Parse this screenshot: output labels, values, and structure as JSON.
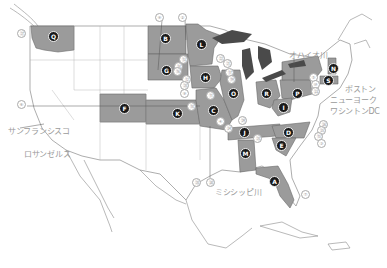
{
  "colors": {
    "highlight_state": "#9b9b9b",
    "land": "#ffffff",
    "border": "#8a8a8a",
    "water": "#4a4a4a",
    "label_text": "#9a9a9a",
    "marker_bg": "#1a1a1a"
  },
  "cities": [
    {
      "id": "sf",
      "label": "サンフランシスコ",
      "x": 8,
      "y": 128
    },
    {
      "id": "la",
      "label": "ロサンゼルス",
      "x": 24,
      "y": 151
    },
    {
      "id": "boston",
      "label": "ボストン",
      "x": 345,
      "y": 86
    },
    {
      "id": "nyc",
      "label": "ニューヨーク",
      "x": 330,
      "y": 97
    },
    {
      "id": "dc",
      "label": "ワシントンDC",
      "x": 330,
      "y": 108
    }
  ],
  "rivers": [
    {
      "id": "ohio",
      "label": "オハイオ川",
      "x": 289,
      "y": 52
    },
    {
      "id": "mississippi",
      "label": "ミシシッピ川",
      "x": 215,
      "y": 189
    }
  ],
  "misc_labels": [
    {
      "id": "wisconsin-label",
      "label": "ネオジオゴ",
      "x": 222,
      "y": 47
    }
  ],
  "state_markers": [
    {
      "letter": "Q",
      "x": 52,
      "y": 36
    },
    {
      "letter": "B",
      "x": 164,
      "y": 38
    },
    {
      "letter": "L",
      "x": 200,
      "y": 44
    },
    {
      "letter": "G",
      "x": 165,
      "y": 70
    },
    {
      "letter": "H",
      "x": 204,
      "y": 77
    },
    {
      "letter": "O",
      "x": 232,
      "y": 93
    },
    {
      "letter": "R",
      "x": 265,
      "y": 93
    },
    {
      "letter": "P",
      "x": 296,
      "y": 93
    },
    {
      "letter": "I",
      "x": 282,
      "y": 107
    },
    {
      "letter": "N",
      "x": 332,
      "y": 68
    },
    {
      "letter": "S",
      "x": 327,
      "y": 80
    },
    {
      "letter": "F",
      "x": 123,
      "y": 108
    },
    {
      "letter": "K",
      "x": 176,
      "y": 113
    },
    {
      "letter": "C",
      "x": 212,
      "y": 110
    },
    {
      "letter": "J",
      "x": 243,
      "y": 132
    },
    {
      "letter": "D",
      "x": 287,
      "y": 132
    },
    {
      "letter": "E",
      "x": 280,
      "y": 145
    },
    {
      "letter": "M",
      "x": 244,
      "y": 153
    },
    {
      "letter": "A",
      "x": 273,
      "y": 181
    }
  ],
  "numbered_markers": [
    {
      "n": "⑧",
      "x": 158,
      "y": 16
    },
    {
      "n": "②",
      "x": 181,
      "y": 16
    },
    {
      "n": "㉗",
      "x": 20,
      "y": 32
    },
    {
      "n": "⑥",
      "x": 20,
      "y": 103
    },
    {
      "n": "⑬",
      "x": 182,
      "y": 58
    },
    {
      "n": "⑭",
      "x": 177,
      "y": 65
    },
    {
      "n": "⑯",
      "x": 176,
      "y": 70
    },
    {
      "n": "⑫",
      "x": 185,
      "y": 78
    },
    {
      "n": "⑳",
      "x": 183,
      "y": 84
    },
    {
      "n": "⑨",
      "x": 183,
      "y": 92
    },
    {
      "n": "㉒",
      "x": 219,
      "y": 57
    },
    {
      "n": "㉑",
      "x": 226,
      "y": 62
    },
    {
      "n": "⑰",
      "x": 228,
      "y": 71
    },
    {
      "n": "⑲",
      "x": 230,
      "y": 78
    },
    {
      "n": "⑪",
      "x": 209,
      "y": 94
    },
    {
      "n": "⑱",
      "x": 190,
      "y": 105
    },
    {
      "n": "④",
      "x": 219,
      "y": 120
    },
    {
      "n": "⑤",
      "x": 312,
      "y": 76
    },
    {
      "n": "⑩",
      "x": 314,
      "y": 83
    },
    {
      "n": "㉓",
      "x": 314,
      "y": 90
    },
    {
      "n": "㉔",
      "x": 227,
      "y": 127
    },
    {
      "n": "㉖",
      "x": 322,
      "y": 123
    },
    {
      "n": "㉕",
      "x": 320,
      "y": 129
    },
    {
      "n": "⑮",
      "x": 317,
      "y": 135
    },
    {
      "n": "③",
      "x": 320,
      "y": 142
    },
    {
      "n": "㉘",
      "x": 256,
      "y": 137
    },
    {
      "n": "㉙",
      "x": 241,
      "y": 119
    },
    {
      "n": "㉚",
      "x": 209,
      "y": 181
    },
    {
      "n": "⑳",
      "x": 195,
      "y": 181
    },
    {
      "n": "⑦",
      "x": 304,
      "y": 193
    }
  ]
}
